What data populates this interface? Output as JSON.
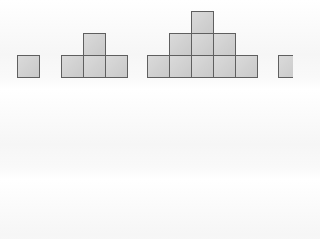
{
  "figure": {
    "cell_size_px": 22,
    "fill_color": "#cfcfcf",
    "border_color": "#5f5f5f",
    "groups": [
      {
        "name": "figure-1",
        "cells": [
          [
            0,
            0
          ]
        ],
        "origin_x": 17
      },
      {
        "name": "figure-2",
        "cells": [
          [
            0,
            0
          ],
          [
            1,
            0
          ],
          [
            2,
            0
          ],
          [
            1,
            1
          ]
        ],
        "origin_x": 61
      },
      {
        "name": "figure-3",
        "cells": [
          [
            0,
            0
          ],
          [
            1,
            0
          ],
          [
            2,
            0
          ],
          [
            3,
            0
          ],
          [
            4,
            0
          ],
          [
            1,
            1
          ],
          [
            2,
            1
          ],
          [
            3,
            1
          ],
          [
            2,
            2
          ]
        ],
        "origin_x": 147
      },
      {
        "name": "figure-4-partial",
        "cells": [
          [
            0,
            0
          ]
        ],
        "origin_x": 278
      }
    ],
    "baseline_y": 77
  }
}
